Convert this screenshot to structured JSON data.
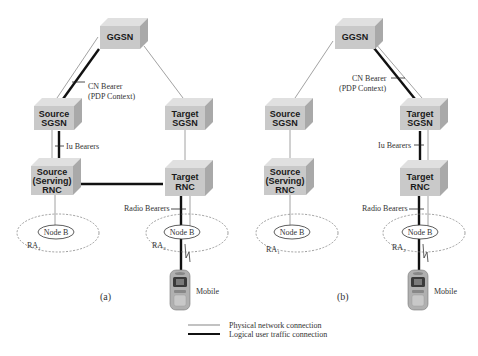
{
  "panels": [
    {
      "id": "a",
      "label": "(a)",
      "nodes": {
        "ggsn": [
          "GGSN"
        ],
        "source_sgsn": [
          "Source",
          "SGSN"
        ],
        "target_sgsn": [
          "Target",
          "SGSN"
        ],
        "source_rnc": [
          "Source",
          "(Serving)",
          "RNC"
        ],
        "target_rnc": [
          "Target",
          "RNC"
        ]
      },
      "node_b_left": "Node B",
      "node_b_right": "Node B",
      "ra_left": "RA",
      "ra_left_sub": "1",
      "ra_right": "RA",
      "ra_right_sub": "2",
      "cn_bearer": [
        "CN Bearer",
        "(PDP Context)"
      ],
      "iu_bearers": "Iu Bearers",
      "radio_bearers": "Radio Bearers",
      "mobile": "Mobile"
    },
    {
      "id": "b",
      "label": "(b)",
      "nodes": {
        "ggsn": [
          "GGSN"
        ],
        "source_sgsn": [
          "Source",
          "SGSN"
        ],
        "target_sgsn": [
          "Target",
          "SGSN"
        ],
        "source_rnc": [
          "Source",
          "(Serving)",
          "RNC"
        ],
        "target_rnc": [
          "Target",
          "RNC"
        ]
      },
      "node_b_left": "Node B",
      "node_b_right": "Node B",
      "ra_left": "RA",
      "ra_left_sub": "1",
      "ra_right": "RA",
      "ra_right_sub": "2",
      "cn_bearer": [
        "CN Bearer",
        "(PDP Context)"
      ],
      "iu_bearers": "Iu Bearers",
      "radio_bearers": "Radio Bearers",
      "mobile": "Mobile"
    }
  ],
  "legend": {
    "physical": "Physical network connection",
    "logical": "Logical user traffic connection"
  },
  "colors": {
    "box_front": "#c8c8c8",
    "box_top": "#dedede",
    "box_side": "#a8a8a8",
    "physical_line": "#8a8a8a",
    "logical_line": "#111111"
  }
}
